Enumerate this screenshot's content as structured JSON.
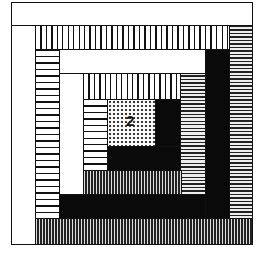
{
  "diagram": {
    "type": "log-cabin-quilt-block",
    "center_label": "2",
    "patches": [
      {
        "id": "top-white-outer",
        "fill": "white"
      },
      {
        "id": "left-white-outer",
        "fill": "white"
      },
      {
        "id": "top-vstripe-outer",
        "fill": "vertical-stripes"
      },
      {
        "id": "right-hstripe-outer",
        "fill": "horizontal-stripes-fine"
      },
      {
        "id": "bottom-vstripe-outer",
        "fill": "vertical-stripes-fine"
      },
      {
        "id": "left-hstripe-mid",
        "fill": "horizontal-stripes"
      },
      {
        "id": "top-white-mid",
        "fill": "white"
      },
      {
        "id": "right-black-mid",
        "fill": "black"
      },
      {
        "id": "bottom-black-mid",
        "fill": "black"
      },
      {
        "id": "left-white-inner",
        "fill": "white"
      },
      {
        "id": "top-vstripe-inner",
        "fill": "vertical-stripes"
      },
      {
        "id": "right-hstripe-inner",
        "fill": "horizontal-stripes-fine"
      },
      {
        "id": "bottom-vstripe-inner",
        "fill": "vertical-stripes-fine"
      },
      {
        "id": "left-hstripe-inner",
        "fill": "horizontal-stripes"
      },
      {
        "id": "right-black-core",
        "fill": "black"
      },
      {
        "id": "bottom-black-core",
        "fill": "black"
      },
      {
        "id": "center",
        "fill": "dots"
      }
    ]
  }
}
